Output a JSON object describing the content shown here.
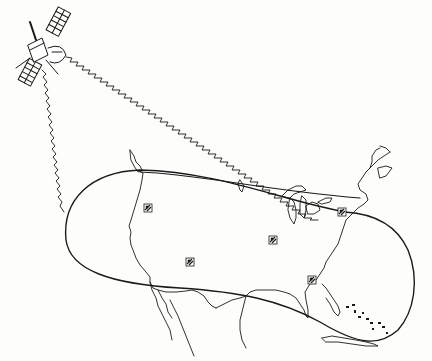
{
  "diagram": {
    "colors": {
      "ink": "#1a1a1a",
      "background": "#fdfdfc"
    },
    "satellite": {
      "icon": "satellite-icon",
      "x": 35,
      "y": 45
    },
    "beams": [
      {
        "name": "beam-west",
        "from": [
          42,
          68
        ],
        "to": [
          65,
          215
        ]
      },
      {
        "name": "beam-east",
        "from": [
          65,
          58
        ],
        "to": [
          345,
          200
        ]
      }
    ],
    "footprint": {
      "shape": "elongated-oval",
      "region": "continental-us"
    },
    "ground_stations": [
      {
        "icon": "ground-station-icon",
        "x": 148,
        "y": 208
      },
      {
        "icon": "ground-station-icon",
        "x": 273,
        "y": 240
      },
      {
        "icon": "ground-station-icon",
        "x": 190,
        "y": 262
      },
      {
        "icon": "ground-station-icon",
        "x": 312,
        "y": 280
      },
      {
        "icon": "ground-station-icon",
        "x": 342,
        "y": 212
      }
    ]
  }
}
